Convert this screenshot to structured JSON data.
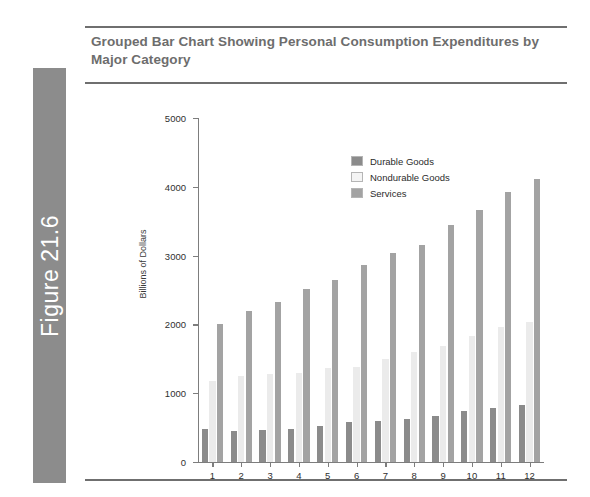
{
  "figure": {
    "tab_label": "Figure 21.6"
  },
  "chart_title": "Grouped Bar Chart Showing Personal Consumption Expenditures by Major Category",
  "chart_data": {
    "type": "bar",
    "title": "Grouped Bar Chart Showing Personal Consumption Expenditures by Major Category",
    "xlabel": "",
    "ylabel": "Billions of Dollars",
    "ylim": [
      0,
      5000
    ],
    "yticks": [
      0,
      1000,
      2000,
      3000,
      4000,
      5000
    ],
    "ytick_labels": [
      "0",
      "1000",
      "2000",
      "3000",
      "4000",
      "5000"
    ],
    "grid": false,
    "legend_position": "top-left-inside",
    "categories": [
      "1",
      "2",
      "3",
      "4",
      "5",
      "6",
      "7",
      "8",
      "9",
      "10",
      "11",
      "12"
    ],
    "series": [
      {
        "name": "Durable Goods",
        "color": "#8b8b8b",
        "values": [
          480,
          450,
          460,
          480,
          530,
          580,
          600,
          630,
          670,
          740,
          790,
          830
        ]
      },
      {
        "name": "Nondurable Goods",
        "color": "#ebebeb",
        "values": [
          1180,
          1250,
          1280,
          1300,
          1360,
          1380,
          1500,
          1600,
          1680,
          1830,
          1960,
          2030
        ]
      },
      {
        "name": "Services",
        "color": "#a3a3a3",
        "values": [
          2010,
          2200,
          2320,
          2510,
          2650,
          2870,
          3040,
          3160,
          3440,
          3660,
          3920,
          4120
        ]
      }
    ]
  }
}
